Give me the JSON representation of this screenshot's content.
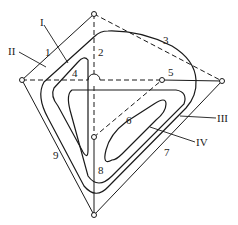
{
  "diagram": {
    "nodes": [
      {
        "id": "top",
        "x": 94,
        "y": 14
      },
      {
        "id": "left",
        "x": 22,
        "y": 80
      },
      {
        "id": "right",
        "x": 222,
        "y": 81
      },
      {
        "id": "bottom",
        "x": 94,
        "y": 215
      },
      {
        "id": "inner",
        "x": 94,
        "y": 137
      },
      {
        "id": "mid-right",
        "x": 162,
        "y": 80
      }
    ],
    "edge_labels": {
      "e1": "1",
      "e2": "2",
      "e3": "3",
      "e4": "4",
      "e5": "5",
      "e6": "6",
      "e7": "7",
      "e8": "8",
      "e9": "9"
    },
    "contour_labels": {
      "c1": "I",
      "c2": "II",
      "c3": "III",
      "c4": "IV"
    },
    "colors": {
      "stroke": "#1a1a1a",
      "background": "#ffffff"
    }
  }
}
